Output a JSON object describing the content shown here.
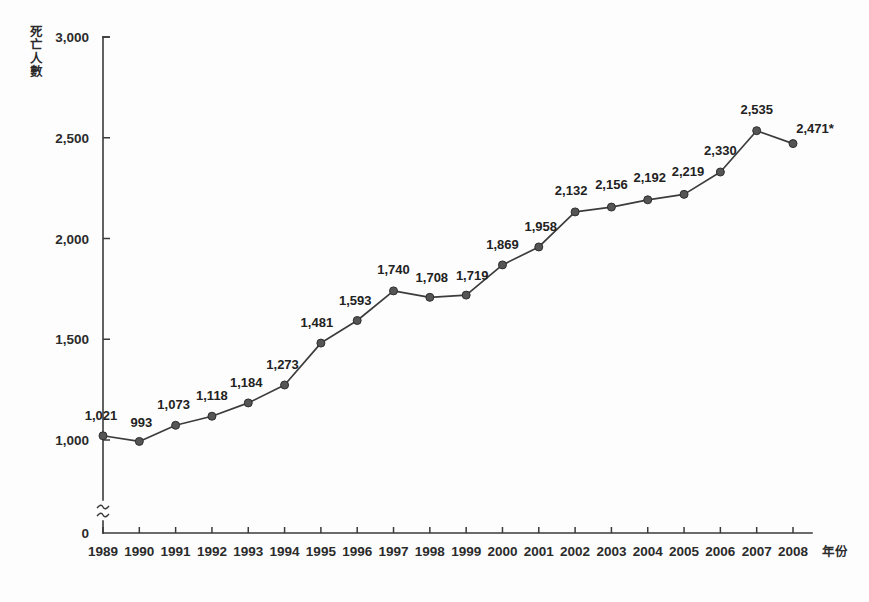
{
  "chart_data": {
    "type": "line",
    "title": "",
    "xlabel": "年份",
    "ylabel": "死亡人數",
    "x": [
      1989,
      1990,
      1991,
      1992,
      1993,
      1994,
      1995,
      1996,
      1997,
      1998,
      1999,
      2000,
      2001,
      2002,
      2003,
      2004,
      2005,
      2006,
      2007,
      2008
    ],
    "categories": [
      "1989",
      "1990",
      "1991",
      "1992",
      "1993",
      "1994",
      "1995",
      "1996",
      "1997",
      "1998",
      "1999",
      "2000",
      "2001",
      "2002",
      "2003",
      "2004",
      "2005",
      "2006",
      "2007",
      "2008"
    ],
    "values": [
      1021,
      993,
      1073,
      1118,
      1184,
      1273,
      1481,
      1593,
      1740,
      1708,
      1719,
      1869,
      1958,
      2132,
      2156,
      2192,
      2219,
      2330,
      2535,
      2471
    ],
    "point_labels": [
      "1,021",
      "993",
      "1,073",
      "1,118",
      "1,184",
      "1,273",
      "1,481",
      "1,593",
      "1,740",
      "1,708",
      "1,719",
      "1,869",
      "1,958",
      "2,132",
      "2,156",
      "2,192",
      "2,219",
      "2,330",
      "2,535",
      "2,471*"
    ],
    "ylim": [
      1000,
      3000
    ],
    "yticks": [
      1000,
      1500,
      2000,
      2500,
      3000
    ],
    "ytick_labels": [
      "1,000",
      "1,500",
      "2,000",
      "2,500",
      "3,000"
    ],
    "y_zero_label": "0",
    "axis_break": true,
    "grid": false,
    "legend": null,
    "series_color": "#3c3c3c",
    "marker_color": "#555555",
    "axis_color": "#3a3a3a",
    "background_color": "#fdfdfd",
    "annotations": [
      {
        "text": "*",
        "note": "asterisk appended to final 2008 value label 2,471*"
      }
    ]
  }
}
